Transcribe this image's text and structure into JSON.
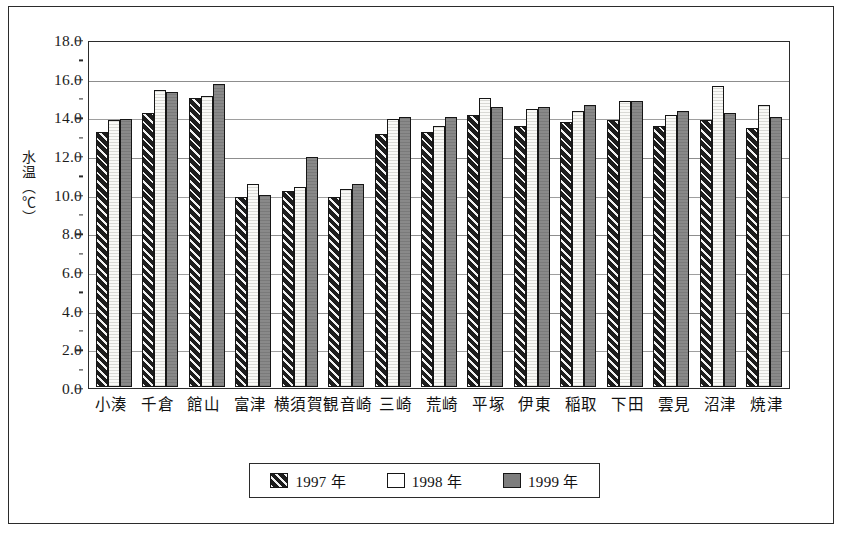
{
  "chart_data": {
    "type": "bar",
    "title": "",
    "xlabel": "",
    "ylabel": "水温（℃）",
    "ylim": [
      0.0,
      18.0
    ],
    "ytick_step": 2.0,
    "yticks": [
      "0.0",
      "2.0",
      "4.0",
      "6.0",
      "8.0",
      "10.0",
      "12.0",
      "14.0",
      "16.0",
      "18.0"
    ],
    "grid": "horizontal",
    "legend_position": "bottom-center",
    "categories": [
      "小湊",
      "千倉",
      "館山",
      "富津",
      "横須賀",
      "観音崎",
      "三崎",
      "荒崎",
      "平塚",
      "伊東",
      "稲取",
      "下田",
      "雲見",
      "沼津",
      "焼津"
    ],
    "series": [
      {
        "name": "1997 年",
        "color": "#1d1d1d",
        "pattern": "diagonal-hatch",
        "values": [
          13.3,
          14.3,
          15.1,
          9.9,
          10.2,
          9.9,
          13.2,
          13.3,
          14.2,
          13.6,
          13.8,
          13.9,
          13.6,
          13.9,
          13.5
        ]
      },
      {
        "name": "1998 年",
        "color": "#ffffff",
        "pattern": "solid-white",
        "values": [
          13.9,
          15.5,
          15.2,
          10.6,
          10.4,
          10.3,
          14.0,
          13.6,
          15.1,
          14.5,
          14.4,
          14.9,
          14.2,
          15.7,
          14.7
        ]
      },
      {
        "name": "1999 年",
        "color": "#7d7d7d",
        "pattern": "solid-gray",
        "values": [
          14.0,
          15.4,
          15.8,
          10.0,
          12.0,
          10.6,
          14.1,
          14.1,
          14.6,
          14.6,
          14.7,
          14.9,
          14.4,
          14.3,
          14.1
        ]
      }
    ]
  },
  "legend": {
    "items": [
      {
        "label": "1997 年"
      },
      {
        "label": "1998 年"
      },
      {
        "label": "1999 年"
      }
    ]
  }
}
